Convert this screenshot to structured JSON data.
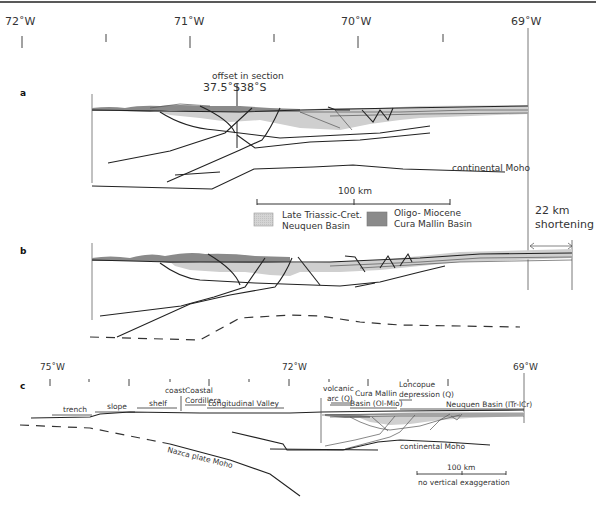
{
  "figure": {
    "top_rule": true,
    "colors": {
      "neuquen_fill": "#cfcfcf",
      "cura_mallin_fill": "#8a8a8a",
      "line": "#222222"
    },
    "top_axis": {
      "labels": [
        {
          "text": "72˚W",
          "x": 18
        },
        {
          "text": "71˚W",
          "x": 190
        },
        {
          "text": "70˚W",
          "x": 358
        },
        {
          "text": "69˚W",
          "x": 528
        }
      ],
      "tick_x": [
        22,
        106,
        190,
        274,
        358,
        443,
        528
      ]
    },
    "panel_a": {
      "label": "a",
      "offset_label": "offset in section",
      "lat_left": "37.5˚S",
      "lat_right": "38˚S",
      "moho_label": "continental Moho"
    },
    "scale_bar": {
      "label": "100 km"
    },
    "legend": {
      "items": [
        {
          "line1": "Late Triassic-Cret.",
          "line2": "Neuquen Basin",
          "swatch": "neuquen"
        },
        {
          "line1": "Oligo- Miocene",
          "line2": "Cura Mallin Basin",
          "swatch": "cura"
        }
      ]
    },
    "shortening": {
      "line1": "22 km",
      "line2": "shortening"
    },
    "panel_b": {
      "label": "b"
    },
    "panel_c": {
      "label": "c",
      "axis": {
        "labels": [
          {
            "text": "75˚W",
            "x": 50
          },
          {
            "text": "72˚W",
            "x": 292
          },
          {
            "text": "69˚W",
            "x": 524
          }
        ],
        "tick_x": [
          50,
          89,
          129,
          170,
          209,
          249,
          289,
          329,
          368,
          408,
          448,
          488,
          527
        ]
      },
      "morpho_units": [
        {
          "text": "trench"
        },
        {
          "text": "slope"
        },
        {
          "text": "shelf"
        },
        {
          "text": "coast"
        },
        {
          "text": "Coastal"
        },
        {
          "text": "Cordillera"
        },
        {
          "text": "Longitudinal Valley"
        },
        {
          "text": "volcanic"
        },
        {
          "text": "arc (Q)"
        },
        {
          "text": "Cura Mallin"
        },
        {
          "text": "Basin (Ol-Mio)"
        },
        {
          "text": "Loncopue"
        },
        {
          "text": "depression (Q)"
        },
        {
          "text": "Neuquen Basin (lTr-lCr)"
        }
      ],
      "nazca_label": "Nazca plate Moho",
      "moho_label": "continental Moho",
      "scale_label": "100 km",
      "scale_note": "no vertical exaggeration"
    }
  }
}
